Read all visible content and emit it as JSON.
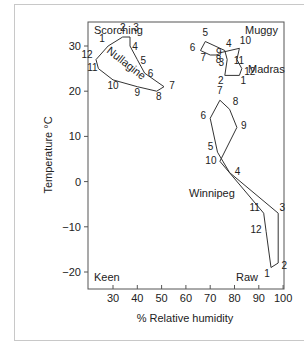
{
  "chart_data": {
    "type": "line",
    "title": "",
    "xlabel": "% Relative humidity",
    "ylabel": "Temperature °C",
    "xlim": [
      20,
      100
    ],
    "ylim": [
      -23,
      33
    ],
    "xticks": [
      30,
      40,
      50,
      60,
      70,
      80,
      90,
      100
    ],
    "yticks": [
      30,
      20,
      10,
      0,
      -10,
      -20
    ],
    "grid": false,
    "corner_labels": {
      "top_left": "Scorching",
      "top_right": "Muggy",
      "bottom_left": "Keen",
      "bottom_right": "Raw"
    },
    "series": [
      {
        "name": "Nullagine",
        "months": [
          1,
          2,
          3,
          4,
          5,
          6,
          7,
          8,
          9,
          10,
          11,
          12
        ],
        "humidity": [
          28,
          34,
          37,
          37,
          40,
          43,
          51,
          48,
          40,
          30,
          24,
          23
        ],
        "temperature": [
          30,
          32,
          32,
          30,
          27,
          24,
          21,
          20,
          21,
          22.5,
          25,
          27
        ]
      },
      {
        "name": "Madras",
        "months": [
          1,
          2,
          3,
          4,
          5,
          6,
          7,
          8,
          9,
          10,
          11,
          12
        ],
        "humidity": [
          82,
          76,
          77,
          76,
          68,
          66,
          70,
          73,
          74,
          82,
          81,
          83
        ],
        "temperature": [
          23.5,
          23.5,
          27,
          29,
          31,
          29,
          28,
          28,
          28.5,
          29.5,
          27,
          25
        ]
      },
      {
        "name": "Winnipeg",
        "months": [
          1,
          2,
          3,
          4,
          5,
          6,
          7,
          8,
          9,
          10,
          11,
          12
        ],
        "humidity": [
          95,
          98,
          98,
          78,
          73,
          70,
          74,
          78,
          81,
          74,
          92,
          93
        ],
        "temperature": [
          -19,
          -18,
          -7,
          2,
          6.5,
          14,
          18,
          16,
          12,
          4.5,
          -7,
          -11
        ]
      }
    ]
  }
}
